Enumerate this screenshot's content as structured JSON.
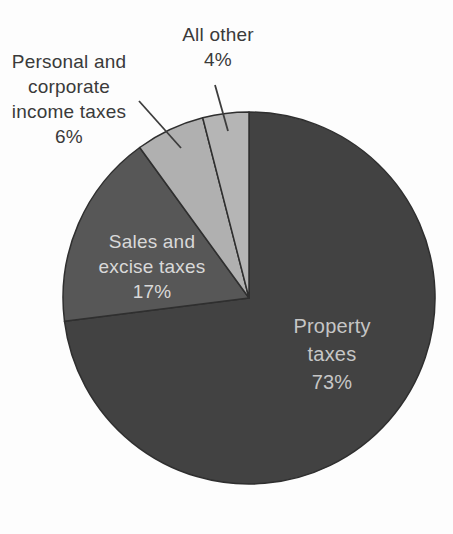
{
  "figure": {
    "background": "#fdfdfd"
  },
  "chart_data": {
    "type": "pie",
    "title": "",
    "direction": "clockwise",
    "start_angle_deg": 0,
    "center": {
      "x": 249,
      "y": 298
    },
    "radius": 186,
    "outline_color": "#2f2f2f",
    "slices": [
      {
        "id": "property-taxes",
        "label": "Property taxes",
        "value_pct": 73,
        "color": "#424242",
        "label_lines": [
          "Property",
          "taxes",
          "73%"
        ],
        "label_color": "#c6c6c6",
        "label_placement": "inside"
      },
      {
        "id": "sales-excise-taxes",
        "label": "Sales and excise taxes",
        "value_pct": 17,
        "color": "#575757",
        "label_lines": [
          "Sales and",
          "excise taxes",
          "17%"
        ],
        "label_color": "#d9d9d9",
        "label_placement": "inside"
      },
      {
        "id": "income-taxes",
        "label": "Personal and corporate income taxes",
        "value_pct": 6,
        "color": "#b0b0b0",
        "label_lines": [
          "Personal and",
          "corporate",
          "income taxes",
          "6%"
        ],
        "label_color": "#3a3a3a",
        "label_placement": "outside"
      },
      {
        "id": "all-other",
        "label": "All other",
        "value_pct": 4,
        "color": "#b5b5b5",
        "label_lines": [
          "All other",
          "4%"
        ],
        "label_color": "#3a3a3a",
        "label_placement": "outside"
      }
    ]
  }
}
